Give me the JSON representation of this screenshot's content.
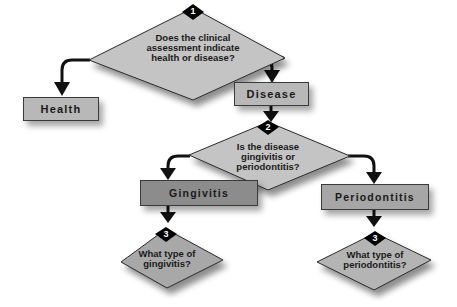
{
  "colors": {
    "diamond_fill": "#c4c4c4",
    "light_box_fill": "#b8b8b8",
    "dark_box_fill": "#8c8c8c",
    "mid_box_fill": "#a6a6a6",
    "stroke": "#1a1a1a"
  },
  "nodes": {
    "q1": {
      "badge": "1",
      "text_lines": [
        "Does the clinical",
        "assessment indicate",
        "health or disease?"
      ]
    },
    "health": {
      "label": "Health"
    },
    "disease": {
      "label": "Disease"
    },
    "q2": {
      "badge": "2",
      "text_lines": [
        "Is the disease",
        "gingivitis or",
        "periodontitis?"
      ]
    },
    "gingivitis": {
      "label": "Gingivitis"
    },
    "periodontitis": {
      "label": "Periodontitis"
    },
    "q3_gingivitis": {
      "badge": "3",
      "text_lines": [
        "What type of",
        "gingivitis?"
      ]
    },
    "q3_periodontitis": {
      "badge": "3",
      "text_lines": [
        "What type of",
        "periodontitis?"
      ]
    }
  },
  "edges": [
    {
      "from": "q1",
      "to": "health"
    },
    {
      "from": "q1",
      "to": "disease"
    },
    {
      "from": "disease",
      "to": "q2"
    },
    {
      "from": "q2",
      "to": "gingivitis"
    },
    {
      "from": "q2",
      "to": "periodontitis"
    },
    {
      "from": "gingivitis",
      "to": "q3_gingivitis"
    },
    {
      "from": "periodontitis",
      "to": "q3_periodontitis"
    }
  ]
}
